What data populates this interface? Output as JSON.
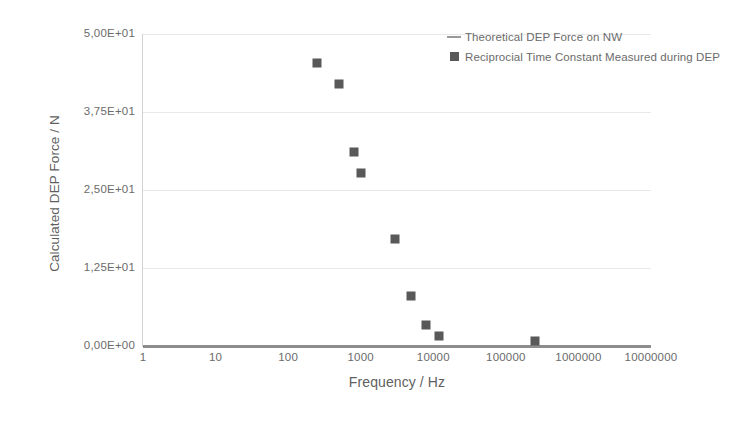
{
  "chart_data": {
    "type": "scatter",
    "title": "",
    "xlabel": "Frequency / Hz",
    "ylabel": "Calculated DEP Force / N",
    "xscale": "log",
    "yscale": "linear",
    "xlim": [
      1,
      10000000
    ],
    "ylim": [
      0,
      50
    ],
    "grid": true,
    "legend_position": "top-right",
    "x_tick_labels": [
      "1",
      "10",
      "100",
      "1000",
      "10000",
      "100000",
      "1000000",
      "10000000"
    ],
    "x_tick_values": [
      1,
      10,
      100,
      1000,
      10000,
      100000,
      1000000,
      10000000
    ],
    "y_tick_labels": [
      "0,00E+00",
      "1,25E+01",
      "2,50E+01",
      "3,75E+01",
      "5,00E+01"
    ],
    "y_tick_values": [
      0,
      12.5,
      25,
      37.5,
      50
    ],
    "series": [
      {
        "name": "Theoretical DEP Force on NW",
        "type": "line",
        "color": "#8d8d8d",
        "x": [
          1,
          10000000
        ],
        "values": [
          0.15,
          0.15
        ]
      },
      {
        "name": "Reciprocial Time Constant Measured during DEP",
        "type": "scatter",
        "marker": "square",
        "color": "#595959",
        "points": [
          {
            "x": 250,
            "y": 45.3
          },
          {
            "x": 500,
            "y": 42.0
          },
          {
            "x": 800,
            "y": 31.1
          },
          {
            "x": 1000,
            "y": 27.8
          },
          {
            "x": 3000,
            "y": 17.2
          },
          {
            "x": 5000,
            "y": 8.0
          },
          {
            "x": 8000,
            "y": 3.4
          },
          {
            "x": 12000,
            "y": 1.6
          },
          {
            "x": 250000,
            "y": 0.8
          }
        ]
      }
    ]
  },
  "legend": {
    "items": [
      {
        "label": "Theoretical DEP Force on NW",
        "key": "line-key-icon"
      },
      {
        "label": "Reciprocial Time Constant Measured during DEP",
        "key": "square-key-icon"
      }
    ]
  }
}
